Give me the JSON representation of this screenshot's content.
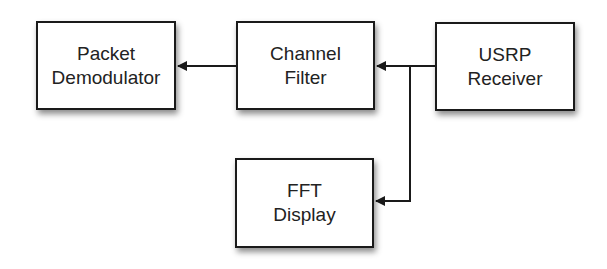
{
  "diagram": {
    "nodes": [
      {
        "id": "packet-demodulator",
        "lines": [
          "Packet",
          "Demodulator"
        ]
      },
      {
        "id": "channel-filter",
        "lines": [
          "Channel",
          "Filter"
        ]
      },
      {
        "id": "usrp-receiver",
        "lines": [
          "USRP",
          "Receiver"
        ]
      },
      {
        "id": "fft-display",
        "lines": [
          "FFT",
          "Display"
        ]
      }
    ],
    "edges": [
      {
        "from": "usrp-receiver",
        "to": "channel-filter"
      },
      {
        "from": "usrp-receiver",
        "to": "fft-display"
      },
      {
        "from": "channel-filter",
        "to": "packet-demodulator"
      }
    ],
    "colors": {
      "stroke": "#1a1a1a",
      "fill": "#ffffff",
      "text": "#222222"
    }
  }
}
